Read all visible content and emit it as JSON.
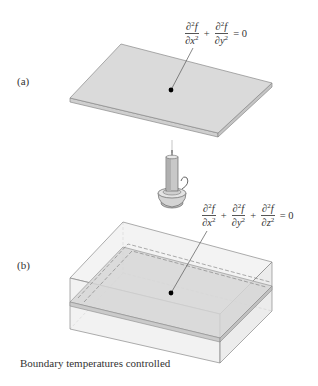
{
  "panels": [
    {
      "label": "(a)",
      "equation": {
        "terms": [
          {
            "num_d": "∂",
            "num_sup": "2",
            "num_var": "f",
            "den_d": "∂",
            "den_var": "x",
            "den_sup": "2"
          },
          {
            "num_d": "∂",
            "num_sup": "2",
            "num_var": "f",
            "den_d": "∂",
            "den_var": "y",
            "den_sup": "2"
          }
        ],
        "plus": "+",
        "rhs": "= 0"
      },
      "description": "2D plate"
    },
    {
      "label": "(b)",
      "equation": {
        "terms": [
          {
            "num_d": "∂",
            "num_sup": "2",
            "num_var": "f",
            "den_d": "∂",
            "den_var": "x",
            "den_sup": "2"
          },
          {
            "num_d": "∂",
            "num_sup": "2",
            "num_var": "f",
            "den_d": "∂",
            "den_var": "y",
            "den_sup": "2"
          },
          {
            "num_d": "∂",
            "num_sup": "2",
            "num_var": "f",
            "den_d": "∂",
            "den_var": "z",
            "den_sup": "2"
          }
        ],
        "plus": "+",
        "rhs": "= 0"
      },
      "description": "3D block with embedded plate"
    }
  ],
  "heat_source": "candle",
  "caption": "Boundary temperatures controlled",
  "colors": {
    "plate_top": "#d9d9d9",
    "plate_edge": "#c4c4c4",
    "outline": "#8a8a8a",
    "box_fill": "#ececec",
    "dot": "#000000"
  }
}
